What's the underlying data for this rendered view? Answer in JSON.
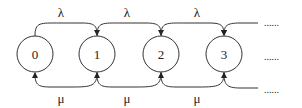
{
  "diagram": {
    "type": "birth-death state transition diagram",
    "states": [
      {
        "label": "0",
        "cx": 35,
        "cy": 54
      },
      {
        "label": "1",
        "cx": 97,
        "cy": 54
      },
      {
        "label": "2",
        "cx": 161,
        "cy": 54
      },
      {
        "label": "3",
        "cx": 224,
        "cy": 54
      }
    ],
    "arrival_label": "λ",
    "service_label": "μ",
    "arrival_labels": [
      {
        "text": "λ",
        "x": 61,
        "y": 16
      },
      {
        "text": "λ",
        "x": 127,
        "y": 16
      },
      {
        "text": "λ",
        "x": 197,
        "y": 16
      }
    ],
    "service_labels": [
      {
        "text": "μ",
        "x": 61,
        "y": 102
      },
      {
        "text": "μ",
        "x": 127,
        "y": 102
      },
      {
        "text": "μ",
        "x": 197,
        "y": 102
      }
    ],
    "continuation": [
      "......",
      "......",
      "......"
    ]
  }
}
